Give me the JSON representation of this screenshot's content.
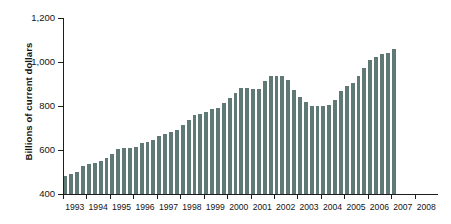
{
  "chart_data": {
    "type": "bar",
    "title": "",
    "xlabel": "",
    "ylabel": "Billions of current dollars",
    "ylim": [
      400,
      1200
    ],
    "ytick_labels": [
      "400",
      "600",
      "800",
      "1,000",
      "1,200"
    ],
    "ytick_values": [
      400,
      600,
      800,
      1000,
      1200
    ],
    "grid": false,
    "legend": "none",
    "xlim": [
      1993,
      2009
    ],
    "xtick_labels": [
      "1993",
      "1994",
      "1995",
      "1996",
      "1997",
      "1998",
      "1999",
      "2000",
      "2001",
      "2002",
      "2003",
      "2004",
      "2005",
      "2006",
      "2007",
      "2008"
    ],
    "xtick_values": [
      1993,
      1994,
      1995,
      1996,
      1997,
      1998,
      1999,
      2000,
      2001,
      2002,
      2003,
      2004,
      2005,
      2006,
      2007,
      2008
    ],
    "bar_color": "#5f7a76",
    "axis_color": "#1d1d1d",
    "background_color": "#ffffff",
    "x": [
      "1993 Q1",
      "1993 Q2",
      "1993 Q3",
      "1993 Q4",
      "1994 Q1",
      "1994 Q2",
      "1994 Q3",
      "1994 Q4",
      "1995 Q1",
      "1995 Q2",
      "1995 Q3",
      "1995 Q4",
      "1996 Q1",
      "1996 Q2",
      "1996 Q3",
      "1996 Q4",
      "1997 Q1",
      "1997 Q2",
      "1997 Q3",
      "1997 Q4",
      "1998 Q1",
      "1998 Q2",
      "1998 Q3",
      "1998 Q4",
      "1999 Q1",
      "1999 Q2",
      "1999 Q3",
      "1999 Q4",
      "2000 Q1",
      "2000 Q2",
      "2000 Q3",
      "2000 Q4",
      "2001 Q1",
      "2001 Q2",
      "2001 Q3",
      "2001 Q4",
      "2002 Q1",
      "2002 Q2",
      "2002 Q3",
      "2002 Q4",
      "2003 Q1",
      "2003 Q2",
      "2003 Q3",
      "2003 Q4",
      "2004 Q1",
      "2004 Q2",
      "2004 Q3",
      "2004 Q4",
      "2005 Q1",
      "2005 Q2"
    ],
    "values": [
      482,
      492,
      500,
      527,
      537,
      543,
      550,
      563,
      581,
      605,
      607,
      608,
      612,
      630,
      638,
      646,
      663,
      672,
      683,
      690,
      715,
      737,
      760,
      765,
      773,
      785,
      792,
      812,
      835,
      858,
      880,
      881,
      878,
      878,
      912,
      937,
      937,
      937,
      918,
      875,
      842,
      818,
      802,
      800,
      802,
      803,
      826,
      866,
      893,
      903
    ],
    "values_tail": [
      938,
      971,
      1010,
      1021,
      1036,
      1042,
      1057
    ]
  }
}
